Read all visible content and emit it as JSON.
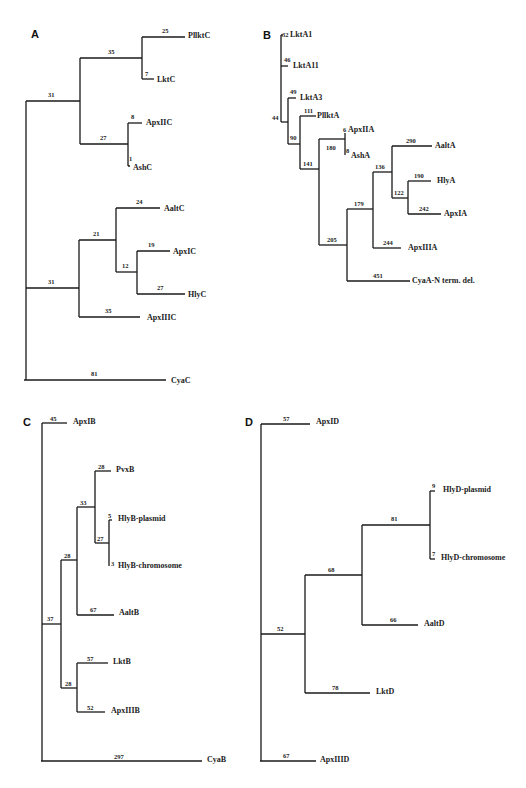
{
  "figure": {
    "panels": [
      {
        "id": "A",
        "label": "A",
        "leaves": [
          "PllktC",
          "LktC",
          "ApxIIC",
          "AshC",
          "AaltC",
          "ApxIC",
          "HlyC",
          "ApxIIIC",
          "CyaC"
        ],
        "branch_lengths": [
          "25",
          "35",
          "7",
          "31",
          "8",
          "27",
          "1",
          "24",
          "21",
          "19",
          "12",
          "27",
          "31",
          "35",
          "81"
        ]
      },
      {
        "id": "B",
        "label": "B",
        "leaves": [
          "LktA1",
          "LktA11",
          "LktA3",
          "PllktA",
          "ApxIIA",
          "AshA",
          "AaltA",
          "HlyA",
          "ApxIA",
          "ApxIIIA",
          "CyaA-N term. del."
        ],
        "branch_lengths": [
          "32",
          "46",
          "49",
          "44",
          "111",
          "90",
          "6",
          "180",
          "8",
          "141",
          "290",
          "136",
          "190",
          "122",
          "242",
          "179",
          "244",
          "205",
          "451"
        ]
      },
      {
        "id": "C",
        "label": "C",
        "leaves": [
          "ApxIB",
          "PvxB",
          "HlyB-plasmid",
          "HlyB-chromosome",
          "AaltB",
          "LktB",
          "ApxIIIB",
          "CyaB"
        ],
        "branch_lengths": [
          "45",
          "28",
          "33",
          "5",
          "27",
          "3",
          "28",
          "67",
          "37",
          "57",
          "28",
          "52",
          "297"
        ]
      },
      {
        "id": "D",
        "label": "D",
        "leaves": [
          "ApxID",
          "HlyD-plasmid",
          "HlyD-chromosome",
          "AaltD",
          "LktD",
          "ApxIIID"
        ],
        "branch_lengths": [
          "57",
          "9",
          "81",
          "7",
          "68",
          "66",
          "52",
          "78",
          "67"
        ]
      }
    ]
  },
  "A": {
    "label": "A",
    "leaves": {
      "PllktC": "PllktC",
      "LktC": "LktC",
      "ApxIIC": "ApxIIC",
      "AshC": "AshC",
      "AaltC": "AaltC",
      "ApxIC": "ApxIC",
      "HlyC": "HlyC",
      "ApxIIIC": "ApxIIIC",
      "CyaC": "CyaC"
    },
    "n": {
      "pllktc": "25",
      "up1": "35",
      "lktc": "7",
      "root_up": "31",
      "apxiic": "8",
      "b27": "27",
      "ashc": "1",
      "aaltc": "24",
      "b21": "21",
      "apxic": "19",
      "b12": "12",
      "hlyc": "27",
      "root_low": "31",
      "apxiiic": "35",
      "cyac": "81"
    }
  },
  "B": {
    "label": "B",
    "leaves": {
      "LktA1": "LktA1",
      "LktA11": "LktA11",
      "LktA3": "LktA3",
      "PllktA": "PllktA",
      "ApxIIA": "ApxIIA",
      "AshA": "AshA",
      "AaltA": "AaltA",
      "HlyA": "HlyA",
      "ApxIA": "ApxIA",
      "ApxIIIA": "ApxIIIA",
      "CyaA": "CyaA-N term. del."
    },
    "n": {
      "lkta1": "32",
      "lkta11": "46",
      "lkta3": "49",
      "b44": "44",
      "pllkta": "111",
      "b90": "90",
      "apxiia": "6",
      "b180": "180",
      "asha": "8",
      "b141": "141",
      "aalta": "290",
      "b136": "136",
      "hlya": "190",
      "b122": "122",
      "apxia": "242",
      "b179": "179",
      "apxiiia": "244",
      "b205": "205",
      "cyaa": "451"
    }
  },
  "C": {
    "label": "C",
    "leaves": {
      "ApxIB": "ApxIB",
      "PvxB": "PvxB",
      "HlyBp": "HlyB-plasmid",
      "HlyBc": "HlyB-chromosome",
      "AaltB": "AaltB",
      "LktB": "LktB",
      "ApxIIIB": "ApxIIIB",
      "CyaB": "CyaB"
    },
    "n": {
      "apxib": "45",
      "pvxb": "28",
      "b33": "33",
      "hlybp": "5",
      "b27": "27",
      "hlybc": "3",
      "b28a": "28",
      "aaltb": "67",
      "b37": "37",
      "lktb": "57",
      "b28b": "28",
      "apxiiib": "52",
      "cyab": "297"
    }
  },
  "D": {
    "label": "D",
    "leaves": {
      "ApxID": "ApxID",
      "HlyDp": "HlyD-plasmid",
      "HlyDc": "HlyD-chromosome",
      "AaltD": "AaltD",
      "LktD": "LktD",
      "ApxIIID": "ApxIIID"
    },
    "n": {
      "apxid": "57",
      "hlydp": "9",
      "b81": "81",
      "hlydc": "7",
      "b68": "68",
      "aaltd": "66",
      "b52": "52",
      "lktd": "78",
      "apxiiid": "67"
    }
  }
}
